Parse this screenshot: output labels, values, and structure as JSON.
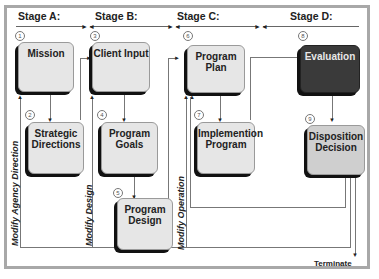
{
  "diagram": {
    "stages": [
      {
        "label": "Stage A:"
      },
      {
        "label": "Stage B:"
      },
      {
        "label": "Stage C:"
      },
      {
        "label": "Stage D:"
      }
    ],
    "nodes": [
      {
        "num": "1",
        "label": "Mission"
      },
      {
        "num": "2",
        "label": "Strategic Directions"
      },
      {
        "num": "3",
        "label": "Client Input"
      },
      {
        "num": "4",
        "label": "Program Goals"
      },
      {
        "num": "5",
        "label": "Program Design"
      },
      {
        "num": "6",
        "label": "Program Plan"
      },
      {
        "num": "7",
        "label": "Implemention Program"
      },
      {
        "num": "8",
        "label": "Evaluation"
      },
      {
        "num": "9",
        "label": "Disposition Decision"
      }
    ],
    "feedback_labels": {
      "agency": "Modify Agency Direction",
      "design": "Modify Design",
      "operation": "Modify Operation"
    },
    "terminate": "Terminate",
    "colors": {
      "box_fill": "#e6e6e6",
      "evaluation_fill": "#3a3a3a",
      "disposition_fill": "#cfcfcf",
      "frame": "#a8a8a8"
    }
  }
}
